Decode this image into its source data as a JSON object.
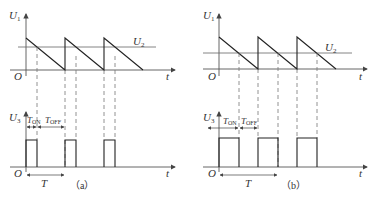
{
  "figure": {
    "panels": [
      {
        "id": "a",
        "caption": "（a）",
        "top_plot": {
          "y_label": "U",
          "y_sub": "1",
          "ref_label": "U",
          "ref_sub": "2",
          "x_label": "t",
          "origin": "O"
        },
        "bottom_plot": {
          "y_label": "U",
          "y_sub": "3",
          "x_label": "t",
          "origin": "O",
          "ton_label": "T",
          "ton_sub": "ON",
          "toff_label": "T",
          "toff_sub": "OFF",
          "period_label": "T"
        }
      },
      {
        "id": "b",
        "caption": "（b）",
        "top_plot": {
          "y_label": "U",
          "y_sub": "1",
          "ref_label": "U",
          "ref_sub": "2",
          "x_label": "t",
          "origin": "O"
        },
        "bottom_plot": {
          "y_label": "U",
          "y_sub": "3",
          "x_label": "t",
          "origin": "O",
          "ton_label": "T",
          "ton_sub": "ON",
          "toff_label": "T",
          "toff_sub": "OFF",
          "period_label": "T"
        }
      }
    ]
  }
}
